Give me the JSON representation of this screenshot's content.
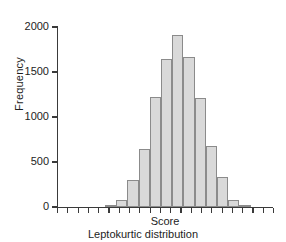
{
  "chart_data": {
    "type": "bar",
    "title": "",
    "subtitle": "",
    "caption": "Leptokurtic distribution",
    "xlabel": "Score",
    "ylabel": "Frequency",
    "ylim": [
      0,
      2000
    ],
    "yticks": [
      0,
      500,
      1000,
      1500,
      2000
    ],
    "ytick_labels": [
      "0",
      "500",
      "1000",
      "1500",
      "2000"
    ],
    "xticks_count": 22,
    "xtick_labels": [],
    "grid": false,
    "legend": null,
    "bar_fill_color": "#d9d9d9",
    "bar_edge_color": "#8b8b8b",
    "axis_color": "#3a3a3a",
    "categories": [
      "b1",
      "b2",
      "b3",
      "b4",
      "b5",
      "b6",
      "b7",
      "b8",
      "b9",
      "b10",
      "b11",
      "b12",
      "b13"
    ],
    "values": [
      25,
      80,
      305,
      640,
      1220,
      1650,
      1910,
      1670,
      1215,
      680,
      330,
      80,
      25
    ],
    "bars": [
      {
        "label": "b1",
        "value": 25,
        "x_index": 0
      },
      {
        "label": "b2",
        "value": 80,
        "x_index": 1
      },
      {
        "label": "b3",
        "value": 305,
        "x_index": 2
      },
      {
        "label": "b4",
        "value": 640,
        "x_index": 3
      },
      {
        "label": "b5",
        "value": 1220,
        "x_index": 4
      },
      {
        "label": "b6",
        "value": 1650,
        "x_index": 5
      },
      {
        "label": "b7",
        "value": 1910,
        "x_index": 6
      },
      {
        "label": "b8",
        "value": 1670,
        "x_index": 7
      },
      {
        "label": "b9",
        "value": 1215,
        "x_index": 8
      },
      {
        "label": "b10",
        "value": 680,
        "x_index": 9
      },
      {
        "label": "b11",
        "value": 330,
        "x_index": 10
      },
      {
        "label": "b12",
        "value": 80,
        "x_index": 11
      },
      {
        "label": "b13",
        "value": 25,
        "x_index": 12
      }
    ],
    "bar_start_px": 47,
    "bar_width_px": 11.2
  }
}
